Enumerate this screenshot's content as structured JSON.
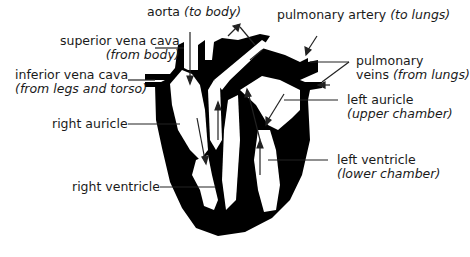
{
  "diagram": {
    "title": "",
    "type": "anatomical heart cross-section",
    "colors": {
      "fill": "#000000",
      "background": "#ffffff",
      "text": "#1a1a1a"
    },
    "labels": {
      "aorta": {
        "name": "aorta",
        "note": "(to body)"
      },
      "superior_vena_cava": {
        "name": "superior vena cava",
        "note": "(from body)"
      },
      "inferior_vena_cava": {
        "name": "inferior vena cava",
        "note": "(from legs and torso)"
      },
      "right_auricle": {
        "name": "right auricle"
      },
      "right_ventricle": {
        "name": "right ventricle"
      },
      "pulmonary_artery": {
        "name": "pulmonary artery",
        "note": "(to lungs)"
      },
      "pulmonary_veins": {
        "name": "pulmonary",
        "name2": "veins",
        "note": "(from lungs)"
      },
      "left_auricle": {
        "name": "left auricle",
        "note": "(upper chamber)"
      },
      "left_ventricle": {
        "name": "left ventricle",
        "note": "(lower chamber)"
      }
    }
  }
}
